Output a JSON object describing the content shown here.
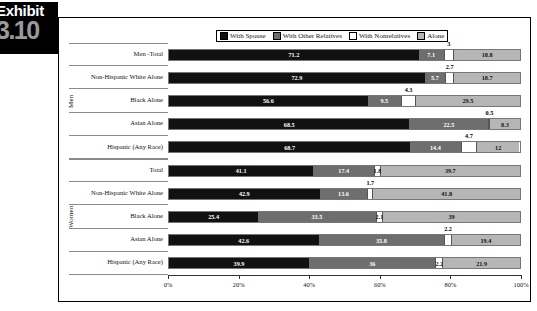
{
  "exhibit": {
    "word": "Exhibit",
    "number": "3.10"
  },
  "legend": {
    "items": [
      {
        "label": "With Spouse",
        "color": "#111111",
        "key": "spouse"
      },
      {
        "label": "With Other Relatives",
        "color": "#6e6e6e",
        "key": "other"
      },
      {
        "label": "With Nonrelatives",
        "color": "#ffffff",
        "key": "nonrel"
      },
      {
        "label": "Alone",
        "color": "#b6b6b6",
        "key": "alone"
      }
    ]
  },
  "groups": [
    {
      "label": "Men"
    },
    {
      "label": "Women"
    }
  ],
  "axis": {
    "ticks": [
      "0%",
      "20%",
      "40%",
      "60%",
      "80%",
      "100%"
    ],
    "min": 0,
    "max": 100
  },
  "chart_data": {
    "type": "bar",
    "orientation": "horizontal",
    "stacked": true,
    "title": "",
    "xlabel": "",
    "ylabel": "",
    "xlim": [
      0,
      100
    ],
    "grid": false,
    "legend_position": "top",
    "series": [
      {
        "name": "With Spouse",
        "color": "#111111"
      },
      {
        "name": "With Other Relatives",
        "color": "#6e6e6e"
      },
      {
        "name": "With Nonrelatives",
        "color": "#ffffff"
      },
      {
        "name": "Alone",
        "color": "#b6b6b6"
      }
    ],
    "groups": [
      {
        "group": "Men",
        "rows": [
          {
            "category": "Men -Total",
            "values": [
              71.2,
              7.1,
              3,
              18.8
            ],
            "labels": [
              "71.2",
              "7.1",
              "3",
              "18.8"
            ],
            "nonrel_label_pos": "above"
          },
          {
            "category": "Non-Hispanic White Alone",
            "values": [
              72.9,
              5.7,
              2.7,
              18.7
            ],
            "labels": [
              "72.9",
              "5.7",
              "2.7",
              "18.7"
            ],
            "nonrel_label_pos": "above"
          },
          {
            "category": "Black Alone",
            "values": [
              56.6,
              9.5,
              4.3,
              29.5
            ],
            "labels": [
              "56.6",
              "9.5",
              "4.3",
              "29.5"
            ],
            "nonrel_label_pos": "above"
          },
          {
            "category": "Asian Alone",
            "values": [
              68.5,
              22.5,
              0.5,
              8.3
            ],
            "labels": [
              "68.5",
              "22.5",
              "0.5",
              "8.3"
            ],
            "nonrel_label_pos": "above"
          },
          {
            "category": "Hispanic (Any Race)",
            "values": [
              68.7,
              14.4,
              4.7,
              12
            ],
            "labels": [
              "68.7",
              "14.4",
              "4.7",
              "12"
            ],
            "nonrel_label_pos": "above"
          }
        ]
      },
      {
        "group": "Women",
        "rows": [
          {
            "category": "Total",
            "values": [
              41.1,
              17.4,
              1.8,
              39.7
            ],
            "labels": [
              "41.1",
              "17.4",
              "1.8",
              "39.7"
            ],
            "nonrel_label_pos": "inline"
          },
          {
            "category": "Non-Hispanic White Alone",
            "values": [
              42.9,
              13.6,
              1.7,
              41.8
            ],
            "labels": [
              "42.9",
              "13.6",
              "1.7",
              "41.8"
            ],
            "nonrel_label_pos": "above"
          },
          {
            "category": "Black Alone",
            "values": [
              25.4,
              33.5,
              2.1,
              39
            ],
            "labels": [
              "25.4",
              "33.5",
              "2.1",
              "39"
            ],
            "nonrel_label_pos": "inline"
          },
          {
            "category": "Asian Alone",
            "values": [
              42.6,
              35.8,
              2.2,
              19.4
            ],
            "labels": [
              "42.6",
              "35.8",
              "2.2",
              "19.4"
            ],
            "nonrel_label_pos": "above"
          },
          {
            "category": "Hispanic (Any Race)",
            "values": [
              39.9,
              36,
              2.2,
              21.9
            ],
            "labels": [
              "39.9",
              "36",
              "2.2",
              "21.9"
            ],
            "nonrel_label_pos": "inline"
          }
        ]
      }
    ]
  }
}
